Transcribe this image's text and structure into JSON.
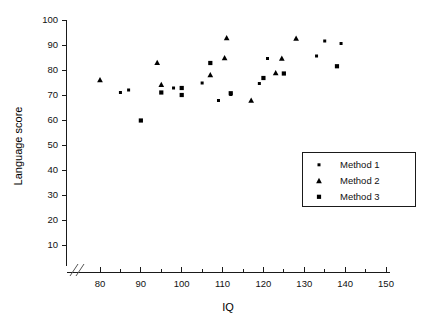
{
  "chart_data": {
    "type": "scatter",
    "title": "",
    "xlabel": "IQ",
    "ylabel": "Language score",
    "xlim": [
      76,
      150
    ],
    "ylim": [
      5,
      100
    ],
    "xticks": [
      80,
      90,
      100,
      110,
      120,
      130,
      140,
      150
    ],
    "yticks": [
      10,
      20,
      30,
      40,
      50,
      60,
      70,
      80,
      90,
      100
    ],
    "grid": false,
    "x_axis_break": true,
    "y_axis_break": true,
    "legend_position": "center-right",
    "series": [
      {
        "name": "Method 1",
        "marker": "small-square",
        "color": "#000000",
        "points": [
          [
            85,
            71.0
          ],
          [
            87,
            72.0
          ],
          [
            98,
            72.8
          ],
          [
            105,
            74.8
          ],
          [
            109,
            67.8
          ],
          [
            112,
            70.2
          ],
          [
            119,
            74.6
          ],
          [
            121,
            84.6
          ],
          [
            133,
            85.6
          ],
          [
            135,
            91.6
          ],
          [
            139,
            90.6
          ]
        ]
      },
      {
        "name": "Method 2",
        "marker": "triangle",
        "color": "#000000",
        "points": [
          [
            80,
            76.0
          ],
          [
            94,
            82.9
          ],
          [
            95,
            74.1
          ],
          [
            107,
            78.0
          ],
          [
            111,
            92.8
          ],
          [
            110.5,
            84.8
          ],
          [
            117,
            67.8
          ],
          [
            123,
            78.8
          ],
          [
            124.5,
            84.6
          ],
          [
            128,
            92.6
          ]
        ]
      },
      {
        "name": "Method 3",
        "marker": "square",
        "color": "#000000",
        "points": [
          [
            90,
            59.8
          ],
          [
            95,
            71.0
          ],
          [
            100,
            72.8
          ],
          [
            100,
            70.0
          ],
          [
            107,
            82.8
          ],
          [
            112,
            70.7
          ],
          [
            120,
            76.8
          ],
          [
            125,
            78.6
          ],
          [
            138,
            81.5
          ]
        ]
      }
    ]
  },
  "axes": {
    "x_title": "IQ",
    "y_title": "Language score",
    "x_tick_labels": [
      "80",
      "90",
      "100",
      "110",
      "120",
      "130",
      "140",
      "150"
    ],
    "y_tick_labels": [
      "10",
      "20",
      "30",
      "40",
      "50",
      "60",
      "70",
      "80",
      "90",
      "100"
    ]
  },
  "legend": {
    "entries": [
      {
        "label": "Method 1",
        "marker": "small-square"
      },
      {
        "label": "Method 2",
        "marker": "triangle"
      },
      {
        "label": "Method 3",
        "marker": "square"
      }
    ]
  }
}
